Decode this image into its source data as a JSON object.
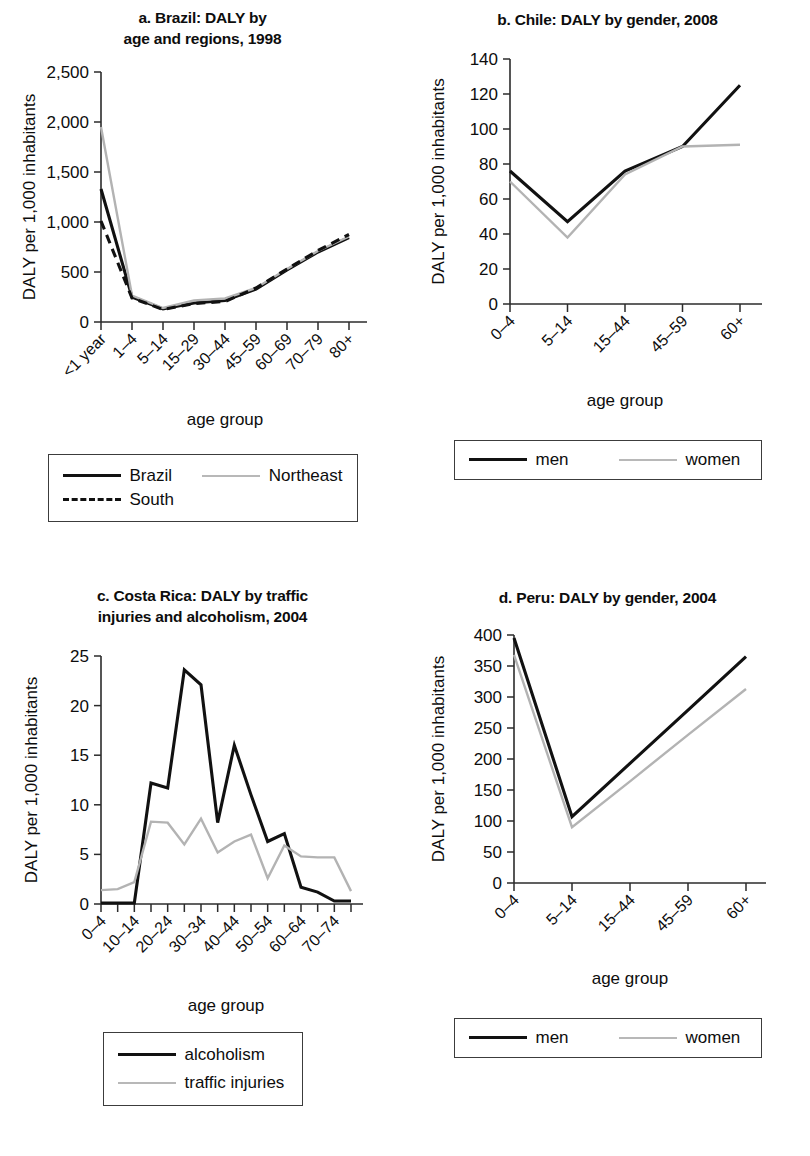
{
  "figure": {
    "axis_titles": {
      "y": "DALY per 1,000 inhabitants",
      "x": "age group"
    }
  },
  "panels": [
    {
      "key": "a",
      "title_line1": "a. Brazil: DALY by",
      "title_line2": "age and regions, 1998",
      "legend": [
        {
          "label": "Brazil",
          "style": "solid"
        },
        {
          "label": "Northeast",
          "style": "gray"
        },
        {
          "label": "South",
          "style": "dashed"
        }
      ],
      "chart_data": {
        "type": "line",
        "title": "a. Brazil: DALY by age and regions, 1998",
        "xlabel": "age group",
        "ylabel": "DALY per 1,000 inhabitants",
        "categories": [
          "<1 year",
          "1–4",
          "5–14",
          "15–29",
          "30–44",
          "45–59",
          "60–69",
          "70–79",
          "80+"
        ],
        "ylim": [
          0,
          2500
        ],
        "yticks": [
          0,
          500,
          1000,
          1500,
          2000,
          2500
        ],
        "yticklabels": [
          "0",
          "500",
          "1,000",
          "1,500",
          "2,000",
          "2,500"
        ],
        "grid": false,
        "legend_position": "below",
        "series": [
          {
            "name": "Brazil",
            "style": "solid",
            "values": [
              1330,
              250,
              130,
              190,
              215,
              330,
              520,
              700,
              845
            ]
          },
          {
            "name": "Northeast",
            "style": "gray",
            "values": [
              1950,
              265,
              140,
              215,
              235,
              340,
              530,
              710,
              855
            ]
          },
          {
            "name": "South",
            "style": "dashed",
            "values": [
              1010,
              240,
              125,
              185,
              205,
              340,
              530,
              715,
              875
            ]
          }
        ]
      }
    },
    {
      "key": "b",
      "title_line1": "b. Chile: DALY by gender, 2008",
      "title_line2": "",
      "legend": [
        {
          "label": "men",
          "style": "solid"
        },
        {
          "label": "women",
          "style": "gray"
        }
      ],
      "chart_data": {
        "type": "line",
        "title": "b. Chile: DALY by gender, 2008",
        "xlabel": "age group",
        "ylabel": "DALY per 1,000 inhabitants",
        "categories": [
          "0–4",
          "5–14",
          "15–44",
          "45–59",
          "60+"
        ],
        "ylim": [
          0,
          140
        ],
        "yticks": [
          0,
          20,
          40,
          60,
          80,
          100,
          120,
          140
        ],
        "yticklabels": [
          "0",
          "20",
          "40",
          "60",
          "80",
          "100",
          "120",
          "140"
        ],
        "grid": false,
        "legend_position": "below",
        "series": [
          {
            "name": "men",
            "style": "solid",
            "values": [
              76,
              47,
              76,
              90,
              125
            ]
          },
          {
            "name": "women",
            "style": "gray",
            "values": [
              70,
              38,
              74,
              90,
              91
            ]
          }
        ]
      }
    },
    {
      "key": "c",
      "title_line1": "c. Costa Rica: DALY by traffic",
      "title_line2": "injuries and alcoholism, 2004",
      "legend": [
        {
          "label": "alcoholism",
          "style": "solid"
        },
        {
          "label": "traffic injuries",
          "style": "gray"
        }
      ],
      "chart_data": {
        "type": "line",
        "title": "c. Costa Rica: DALY by traffic injuries and alcoholism, 2004",
        "xlabel": "age group",
        "ylabel": "DALY per 1,000 inhabitants",
        "categories": [
          "0–4",
          "5–9",
          "10–14",
          "15–19",
          "20–24",
          "25–29",
          "30–34",
          "35–39",
          "40–44",
          "45–49",
          "50–54",
          "55–59",
          "60–64",
          "65–69",
          "70–74",
          "75+"
        ],
        "xticklabels_shown": [
          "0–4",
          "10–14",
          "20–24",
          "30–34",
          "40–44",
          "50–54",
          "60–64",
          "70–74"
        ],
        "ylim": [
          0,
          25
        ],
        "yticks": [
          0,
          5,
          10,
          15,
          20,
          25
        ],
        "yticklabels": [
          "0",
          "5",
          "10",
          "15",
          "20",
          "25"
        ],
        "grid": false,
        "legend_position": "below",
        "series": [
          {
            "name": "alcoholism",
            "style": "solid",
            "values": [
              0.1,
              0.1,
              0.1,
              12.2,
              11.7,
              23.6,
              22.1,
              8.2,
              16.0,
              11.0,
              6.3,
              7.1,
              1.7,
              1.2,
              0.3,
              0.3
            ]
          },
          {
            "name": "traffic injuries",
            "style": "gray",
            "values": [
              1.4,
              1.5,
              2.2,
              8.3,
              8.2,
              6.0,
              8.6,
              5.2,
              6.3,
              7.0,
              2.6,
              5.9,
              4.8,
              4.7,
              4.7,
              1.3
            ]
          }
        ]
      }
    },
    {
      "key": "d",
      "title_line1": "d. Peru: DALY by gender, 2004",
      "title_line2": "",
      "legend": [
        {
          "label": "men",
          "style": "solid"
        },
        {
          "label": "women",
          "style": "gray"
        }
      ],
      "chart_data": {
        "type": "line",
        "title": "d. Peru: DALY by gender, 2004",
        "xlabel": "age group",
        "ylabel": "DALY per 1,000 inhabitants",
        "categories": [
          "0–4",
          "5–14",
          "15–44",
          "45–59",
          "60+"
        ],
        "ylim": [
          0,
          400
        ],
        "yticks": [
          0,
          50,
          100,
          150,
          200,
          250,
          300,
          350,
          400
        ],
        "yticklabels": [
          "0",
          "50",
          "100",
          "150",
          "200",
          "250",
          "300",
          "350",
          "400"
        ],
        "grid": false,
        "legend_position": "below",
        "series": [
          {
            "name": "men",
            "style": "solid",
            "values": [
              395,
              107,
              193,
              279,
              365
            ]
          },
          {
            "name": "women",
            "style": "gray",
            "values": [
              368,
              90,
              164,
              239,
              313
            ]
          }
        ]
      }
    }
  ]
}
